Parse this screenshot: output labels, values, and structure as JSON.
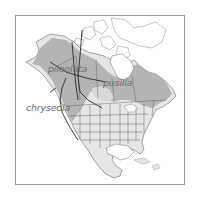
{
  "map": {
    "title": "",
    "colors": {
      "breeding": "#b4b4b4",
      "migration": "#dcdcdc",
      "land": "#e8e8e8",
      "water": "#ffffff",
      "border": "#5a5a5a",
      "frame": "#9a9a9a",
      "label": "#6e6e6e"
    },
    "labels": [
      {
        "id": "pileolata",
        "text": "pileolata"
      },
      {
        "id": "pusilla",
        "text": "pusilla"
      },
      {
        "id": "chryseola",
        "text": "chryseola"
      }
    ],
    "legend": []
  }
}
